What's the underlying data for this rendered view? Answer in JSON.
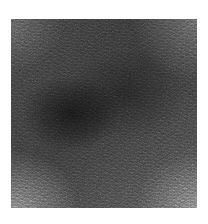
{
  "image": {
    "kind": "grayscale-noise-texture",
    "description": "Square speckled grayscale texture patch with diagonal crosshatch streaks on a white background",
    "canvas": {
      "width_px": 208,
      "height_px": 224,
      "background_color": "#ffffff"
    },
    "patch": {
      "left_px": 11,
      "top_px": 19,
      "width_px": 186,
      "height_px": 189,
      "base_color": "#4a4a4a",
      "dark_color": "#1c1c1c",
      "light_color": "#8e8e8e",
      "mean_gray": "#4d4d4d"
    },
    "features": {
      "dark_band_direction": "upper-left to lower-right diagonal",
      "dark_blob_position": "center-left",
      "bright_corners": [
        "lower-left",
        "lower-right",
        "upper-right"
      ],
      "hatch_angles_deg": [
        28,
        -32,
        4
      ]
    }
  }
}
